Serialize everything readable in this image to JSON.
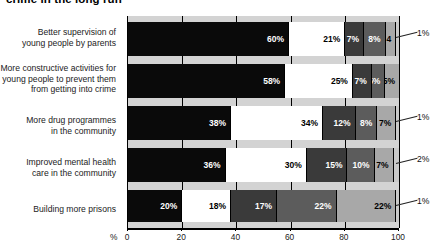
{
  "title": "crime in the long run",
  "axis": {
    "percent_symbol": "%",
    "ticks": [
      0,
      20,
      40,
      60,
      80,
      100
    ],
    "min": 0,
    "max": 100
  },
  "colors": {
    "segment_1": "#0a0a0a",
    "segment_2": "#ffffff",
    "segment_3": "#3a3a3a",
    "segment_4": "#5c5c5c",
    "segment_5": "#a8a8a8",
    "segment_6": "#c9c9c9",
    "plot_background": "#d3d3d3",
    "axis": "#000000"
  },
  "chart_data": {
    "type": "bar",
    "orientation": "horizontal",
    "stacked": true,
    "title": "crime in the long run",
    "xlabel": "%",
    "ylabel": "",
    "xlim": [
      0,
      100
    ],
    "grid": true,
    "legend": "none",
    "categories": [
      "Better supervision of young people by parents",
      "More constructive activities for young people to prevent them from getting into crime",
      "More drug programmes in the community",
      "Improved mental health care in the community",
      "Building more prisons"
    ],
    "rows": [
      {
        "label": "Better supervision of\nyoung people by parents",
        "label_lines": [
          "Better supervision of",
          "young people by parents"
        ],
        "segments": [
          {
            "value": 60,
            "label": "60%",
            "color": "#0a0a0a",
            "text_color": "#ffffff"
          },
          {
            "value": 21,
            "label": "21%",
            "color": "#ffffff",
            "text_color": "#000000"
          },
          {
            "value": 7,
            "label": "7%",
            "color": "#3a3a3a",
            "text_color": "#ffffff"
          },
          {
            "value": 8,
            "label": "8%",
            "color": "#5c5c5c",
            "text_color": "#ffffff"
          },
          {
            "value": 4,
            "label": "4",
            "color": "#a8a8a8",
            "text_color": "#000000"
          },
          {
            "value": 1,
            "label": "",
            "color": "#c9c9c9",
            "text_color": "#000000"
          }
        ],
        "callout": "1%"
      },
      {
        "label": "More constructive activities for\nyoung people to prevent them\nfrom getting into crime",
        "label_lines": [
          "More constructive activities for",
          "young people to prevent them",
          "from getting into crime"
        ],
        "segments": [
          {
            "value": 58,
            "label": "58%",
            "color": "#0a0a0a",
            "text_color": "#ffffff"
          },
          {
            "value": 25,
            "label": "25%",
            "color": "#ffffff",
            "text_color": "#000000"
          },
          {
            "value": 7,
            "label": "7%",
            "color": "#3a3a3a",
            "text_color": "#ffffff"
          },
          {
            "value": 5,
            "label": "5%",
            "color": "#5c5c5c",
            "text_color": "#ffffff"
          },
          {
            "value": 5,
            "label": "5%",
            "color": "#a8a8a8",
            "text_color": "#000000"
          }
        ],
        "callout": ""
      },
      {
        "label": "More drug programmes\nin the community",
        "label_lines": [
          "More drug programmes",
          "in the community"
        ],
        "segments": [
          {
            "value": 38,
            "label": "38%",
            "color": "#0a0a0a",
            "text_color": "#ffffff"
          },
          {
            "value": 34,
            "label": "34%",
            "color": "#ffffff",
            "text_color": "#000000"
          },
          {
            "value": 12,
            "label": "12%",
            "color": "#3a3a3a",
            "text_color": "#ffffff"
          },
          {
            "value": 8,
            "label": "8%",
            "color": "#5c5c5c",
            "text_color": "#ffffff"
          },
          {
            "value": 7,
            "label": "7%",
            "color": "#a8a8a8",
            "text_color": "#000000"
          },
          {
            "value": 1,
            "label": "",
            "color": "#c9c9c9",
            "text_color": "#000000"
          }
        ],
        "callout": "1%"
      },
      {
        "label": "Improved mental health\ncare in the community",
        "label_lines": [
          "Improved mental health",
          "care in the community"
        ],
        "segments": [
          {
            "value": 36,
            "label": "36%",
            "color": "#0a0a0a",
            "text_color": "#ffffff"
          },
          {
            "value": 30,
            "label": "30%",
            "color": "#ffffff",
            "text_color": "#000000"
          },
          {
            "value": 15,
            "label": "15%",
            "color": "#3a3a3a",
            "text_color": "#ffffff"
          },
          {
            "value": 10,
            "label": "10%",
            "color": "#5c5c5c",
            "text_color": "#ffffff"
          },
          {
            "value": 7,
            "label": "7%",
            "color": "#a8a8a8",
            "text_color": "#000000"
          },
          {
            "value": 2,
            "label": "",
            "color": "#c9c9c9",
            "text_color": "#000000"
          }
        ],
        "callout": "2%"
      },
      {
        "label": "Building more prisons",
        "label_lines": [
          "Building more prisons"
        ],
        "segments": [
          {
            "value": 20,
            "label": "20%",
            "color": "#0a0a0a",
            "text_color": "#ffffff"
          },
          {
            "value": 18,
            "label": "18%",
            "color": "#ffffff",
            "text_color": "#000000"
          },
          {
            "value": 17,
            "label": "17%",
            "color": "#3a3a3a",
            "text_color": "#ffffff"
          },
          {
            "value": 22,
            "label": "22%",
            "color": "#5c5c5c",
            "text_color": "#ffffff"
          },
          {
            "value": 22,
            "label": "22%",
            "color": "#a8a8a8",
            "text_color": "#000000"
          },
          {
            "value": 1,
            "label": "",
            "color": "#c9c9c9",
            "text_color": "#000000"
          }
        ],
        "callout": "1%"
      }
    ]
  }
}
